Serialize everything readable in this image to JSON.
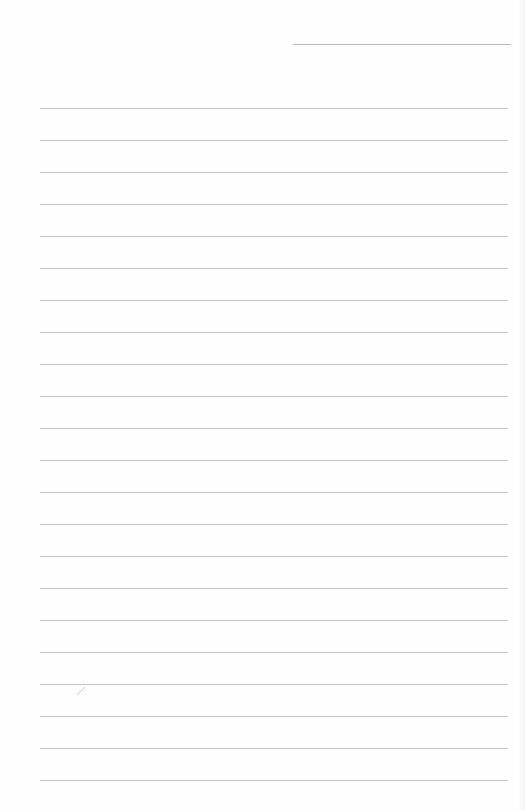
{
  "document": {
    "type": "lined-paper",
    "header_line": {
      "x": 293,
      "y": 44,
      "width": 218
    },
    "rules": {
      "count": 22,
      "start_y": 108,
      "spacing": 32,
      "x": 40,
      "width": 468
    },
    "colors": {
      "paper": "#fefefe",
      "rule": "#c4c4c4",
      "header_rule": "#b8b8b8"
    },
    "marks": [
      {
        "name": "pen-mark",
        "x": 76,
        "y": 686
      }
    ]
  }
}
